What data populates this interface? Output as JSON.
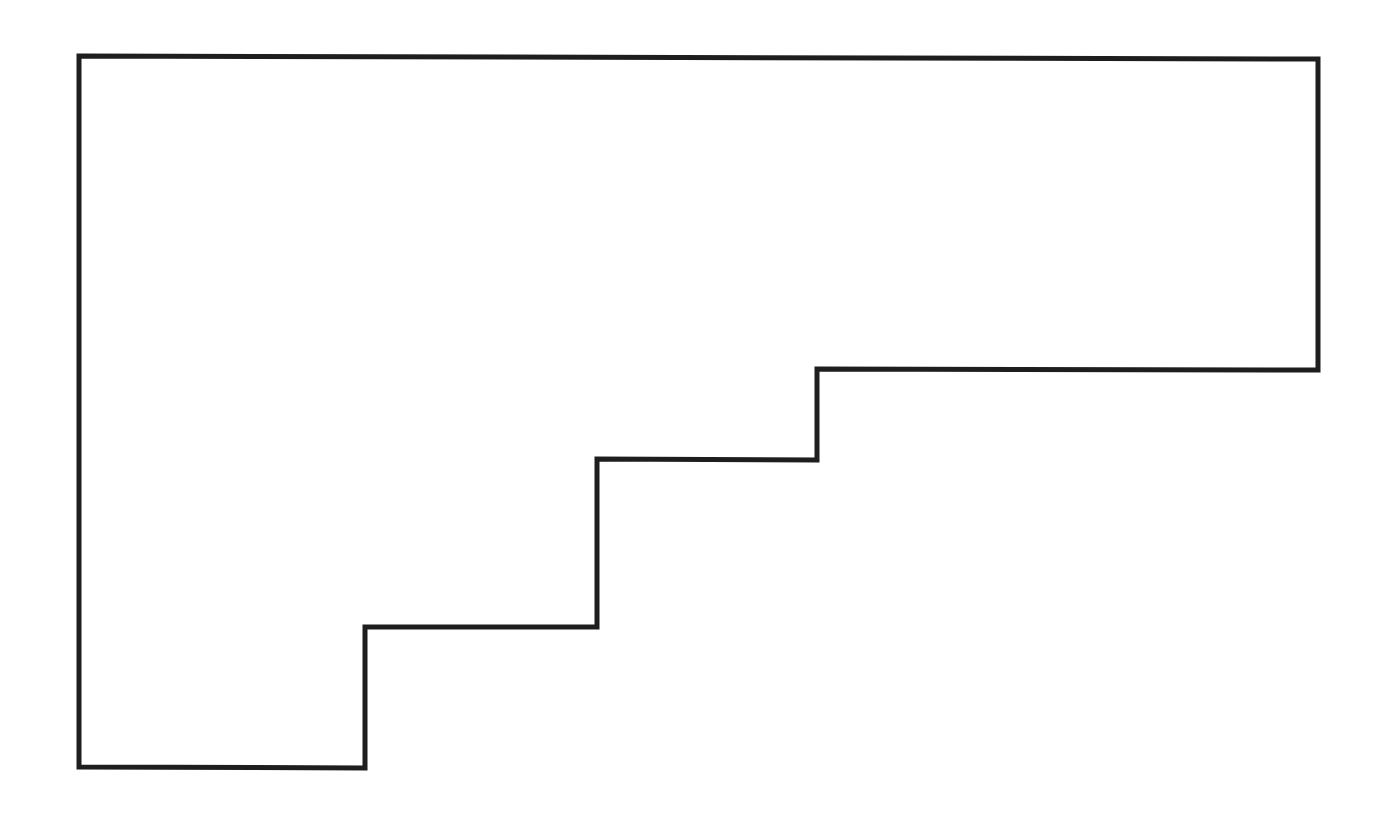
{
  "diagram": {
    "type": "rectilinear-polygon-outline",
    "shape_name": "staircase-polygon",
    "background": "#ffffff",
    "stroke_color": "#1e1e1e",
    "stroke_width": 5,
    "fill": "none",
    "vertices": [
      [
        79,
        56
      ],
      [
        1318,
        59
      ],
      [
        1318,
        370
      ],
      [
        817,
        369
      ],
      [
        817,
        460
      ],
      [
        597,
        459
      ],
      [
        597,
        627
      ],
      [
        365,
        627
      ],
      [
        365,
        768
      ],
      [
        79,
        767
      ]
    ]
  }
}
